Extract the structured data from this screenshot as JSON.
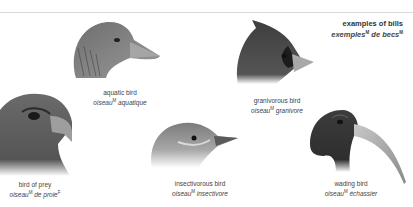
{
  "title": {
    "en": "examples of bills",
    "fr_word1": "exemples",
    "fr_word1_gender": "M",
    "fr_word2": "de becs",
    "fr_word2_gender": "M"
  },
  "birds": [
    {
      "id": "aquatic",
      "en": "aquatic bird",
      "fr_noun": "oiseau",
      "gender": "M",
      "fr_adj": "aquatique",
      "icon": "goose-head-icon"
    },
    {
      "id": "granivorous",
      "en": "granivorous bird",
      "fr_noun": "oiseau",
      "gender": "M",
      "fr_adj": "granivore",
      "icon": "cardinal-head-icon"
    },
    {
      "id": "prey",
      "en": "bird of prey",
      "fr_noun": "oiseau",
      "gender": "M",
      "fr_adj": "de proie",
      "adj_gender": "F",
      "icon": "eagle-head-icon"
    },
    {
      "id": "insectivorous",
      "en": "insectivorous bird",
      "fr_noun": "oiseau",
      "gender": "M",
      "fr_adj": "insectivore",
      "icon": "warbler-head-icon"
    },
    {
      "id": "wading",
      "en": "wading bird",
      "fr_noun": "oiseau",
      "gender": "M",
      "fr_adj": "échassier",
      "icon": "ibis-head-icon"
    }
  ],
  "colors": {
    "rule": "#d9d9d9",
    "text": "#444444",
    "bird_dark": "#3a3a3a",
    "bird_mid": "#7a7a7a",
    "bird_light": "#b8b8b8"
  }
}
